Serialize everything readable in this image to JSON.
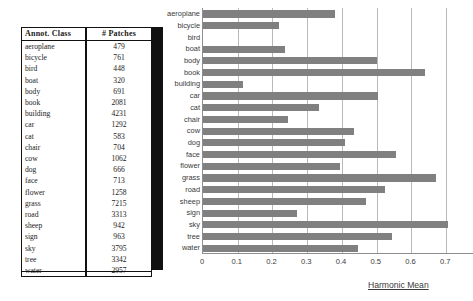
{
  "table": {
    "name": "annotation-class-patch-counts",
    "headers": [
      "Annot. Class",
      "# Patches"
    ],
    "rows": [
      {
        "class": "aeroplane",
        "patches": "479"
      },
      {
        "class": "bicycle",
        "patches": "761"
      },
      {
        "class": "bird",
        "patches": "448"
      },
      {
        "class": "boat",
        "patches": "320"
      },
      {
        "class": "body",
        "patches": "691"
      },
      {
        "class": "book",
        "patches": "2081"
      },
      {
        "class": "building",
        "patches": "4231"
      },
      {
        "class": "car",
        "patches": "1292"
      },
      {
        "class": "cat",
        "patches": "583"
      },
      {
        "class": "chair",
        "patches": "704"
      },
      {
        "class": "cow",
        "patches": "1062"
      },
      {
        "class": "dog",
        "patches": "666"
      },
      {
        "class": "face",
        "patches": "713"
      },
      {
        "class": "flower",
        "patches": "1258"
      },
      {
        "class": "grass",
        "patches": "7215"
      },
      {
        "class": "road",
        "patches": "3313"
      },
      {
        "class": "sheep",
        "patches": "942"
      },
      {
        "class": "sign",
        "patches": "963"
      },
      {
        "class": "sky",
        "patches": "3795"
      },
      {
        "class": "tree",
        "patches": "3342"
      },
      {
        "class": "water",
        "patches": "2957"
      }
    ]
  },
  "chart_data": {
    "type": "bar",
    "orientation": "horizontal",
    "title": "",
    "xlabel": "Harmonic Mean",
    "ylabel": "",
    "xlim": [
      0,
      0.78
    ],
    "xticks": [
      0,
      0.1,
      0.2,
      0.3,
      0.4,
      0.5,
      0.6,
      0.7
    ],
    "xtick_labels": [
      "0",
      "0.1",
      "0.2",
      "0.3",
      "0.4",
      "0.5",
      "0.6",
      "0.7"
    ],
    "grid": "vertical",
    "legend": "none",
    "bar_color": "#808080",
    "categories": [
      "aeroplane",
      "bicycle",
      "bird",
      "boat",
      "body",
      "book",
      "building",
      "car",
      "cat",
      "chair",
      "cow",
      "dog",
      "face",
      "flower",
      "grass",
      "road",
      "sheep",
      "sign",
      "sky",
      "tree",
      "water"
    ],
    "values": [
      0.38,
      0.22,
      0.0,
      0.235,
      0.5,
      0.64,
      0.115,
      0.505,
      0.335,
      0.245,
      0.435,
      0.41,
      0.555,
      0.395,
      0.67,
      0.525,
      0.47,
      0.27,
      0.705,
      0.545,
      0.445
    ]
  },
  "colors": {
    "bar": "#808080",
    "gridline": "#b9b9b9",
    "axis": "#8e8e8e",
    "text": "#3a3a3a",
    "table_rule": "#111111",
    "scan_artifact": "#111111"
  }
}
